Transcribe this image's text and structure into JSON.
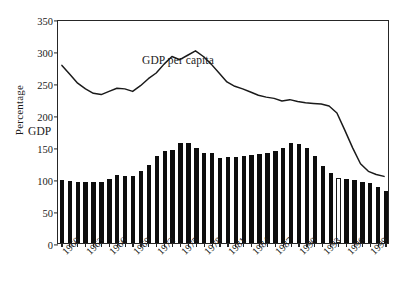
{
  "chart_data": {
    "type": "bar",
    "title": "",
    "subtitle": "",
    "xlabel": "",
    "ylabel": "Percentage",
    "ylim": [
      0,
      350
    ],
    "ytick_values": [
      0,
      50,
      100,
      150,
      200,
      250,
      300,
      350
    ],
    "ytick_labels": [
      "0",
      "50",
      "100",
      "150",
      "200",
      "250",
      "300",
      "350"
    ],
    "grid": false,
    "legend_position": "inline-annotations",
    "x_tick_labels": [
      "1960",
      "1963",
      "1966",
      "1969",
      "1972",
      "1975",
      "1978",
      "1981",
      "1984",
      "1987",
      "1990",
      "1993",
      "1996",
      "1999"
    ],
    "x_tick_step_years": 3,
    "categories": [
      "1960",
      "1961",
      "1962",
      "1963",
      "1964",
      "1965",
      "1966",
      "1967",
      "1968",
      "1969",
      "1970",
      "1971",
      "1972",
      "1973",
      "1974",
      "1975",
      "1976",
      "1977",
      "1978",
      "1979",
      "1980",
      "1981",
      "1982",
      "1983",
      "1984",
      "1985",
      "1986",
      "1987",
      "1988",
      "1989",
      "1990",
      "1991",
      "1992",
      "1993",
      "1994",
      "1995",
      "1996",
      "1997",
      "1998",
      "1999",
      "2000",
      "2001"
    ],
    "series": [
      {
        "name": "GDP",
        "type": "bar",
        "color": "#0d0d0d",
        "highlight_index": 35,
        "highlight_style": "hollow-white-outlined",
        "values": [
          99,
          97,
          96,
          96,
          96,
          95,
          100,
          106,
          105,
          105,
          113,
          122,
          136,
          144,
          145,
          157,
          156,
          148,
          140,
          140,
          133,
          135,
          134,
          136,
          137,
          139,
          140,
          143,
          148,
          156,
          155,
          148,
          136,
          121,
          109,
          102,
          100,
          99,
          96,
          93,
          88,
          81
        ]
      },
      {
        "name": "GDP per capita",
        "type": "line",
        "color": "#1a1a1a",
        "values": [
          280,
          266,
          252,
          243,
          236,
          234,
          239,
          244,
          243,
          239,
          248,
          259,
          268,
          282,
          294,
          289,
          296,
          303,
          294,
          282,
          268,
          254,
          247,
          243,
          238,
          233,
          230,
          228,
          224,
          226,
          223,
          221,
          220,
          219,
          216,
          205,
          178,
          150,
          125,
          113,
          108,
          105
        ]
      }
    ],
    "annotations": [
      {
        "id": "gdp-per-capita",
        "text": "GDP per capita",
        "x_year": "1977",
        "y_value": 248
      },
      {
        "id": "gdp",
        "text": "GDP",
        "x_year": "1964",
        "y_value": 170
      }
    ]
  },
  "colors": {
    "axis": "#262626",
    "bar_fill": "#0d0d0d",
    "line": "#1a1a1a",
    "background": "#ffffff"
  }
}
